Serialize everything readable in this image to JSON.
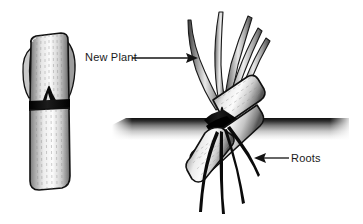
{
  "figure": {
    "background_color": "#ffffff",
    "width": 363,
    "height": 224,
    "ink_color": "#111111",
    "fill_light": "#f2f2f2",
    "fill_mid": "#b9b9b9",
    "fill_dark": "#4a4a4a"
  },
  "labels": {
    "new_plant": "New Plant",
    "roots": "Roots"
  },
  "annotations": [
    {
      "name": "new-plant-callout",
      "text": "New Plant",
      "arrow_direction": "right",
      "text_x": 85,
      "text_y": 52,
      "line_from": [
        132,
        58
      ],
      "line_to": [
        196,
        58
      ]
    },
    {
      "name": "roots-callout",
      "text": "Roots",
      "arrow_direction": "left",
      "text_x": 291,
      "text_y": 153,
      "line_from": [
        288,
        158
      ],
      "line_to": [
        256,
        158
      ]
    }
  ],
  "elements": {
    "left_cutting": {
      "name": "stem-cutting-unplanted",
      "orientation": "vertical",
      "node_band_color": "#0d0d0d",
      "parts": [
        "upper-internode",
        "node-band",
        "bud",
        "lower-internode"
      ]
    },
    "right_cutting": {
      "name": "stem-cutting-planted",
      "orientation": "diagonal",
      "node_band_color": "#0d0d0d",
      "shoot_count": 5,
      "root_count": 4
    },
    "soil_line": {
      "name": "soil-surface-line",
      "x_start": 112,
      "x_end": 349,
      "y": 124,
      "style": "gradient-band-dark-top"
    }
  }
}
